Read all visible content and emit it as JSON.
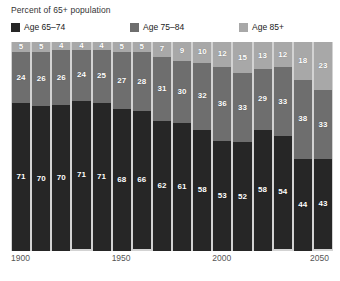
{
  "chart": {
    "title": "Percent of 65+ population",
    "legend": [
      {
        "label": "Age 65–74",
        "color": "#262626"
      },
      {
        "label": "Age 75–84",
        "color": "#6e6e6e"
      },
      {
        "label": "Age 85+",
        "color": "#a8a8a8"
      }
    ],
    "axis_ticks": [
      {
        "label": "1900",
        "pos": 0
      },
      {
        "label": "1950",
        "pos": 5
      },
      {
        "label": "2000",
        "pos": 10
      },
      {
        "label": "2050",
        "pos": 15
      }
    ],
    "plot_bg": "#d3d3d3"
  },
  "chart_data": {
    "type": "bar",
    "title": "Percent of 65+ population",
    "xlabel": "",
    "ylabel": "Percent of 65+ population",
    "ylim": [
      0,
      100
    ],
    "grid": false,
    "legend_position": "top",
    "stacked": true,
    "categories": [
      "1900",
      "1910",
      "1920",
      "1930",
      "1940",
      "1950",
      "1960",
      "1970",
      "1980",
      "1990",
      "2000",
      "2010",
      "2020",
      "2030",
      "2040",
      "2050"
    ],
    "tick_labels": [
      "1900",
      "1950",
      "2000",
      "2050"
    ],
    "series": [
      {
        "name": "Age 65–74",
        "color": "#262626",
        "values": [
          71,
          70,
          70,
          71,
          71,
          68,
          66,
          62,
          61,
          58,
          53,
          52,
          58,
          54,
          44,
          43
        ]
      },
      {
        "name": "Age 75–84",
        "color": "#6e6e6e",
        "values": [
          24,
          26,
          26,
          24,
          25,
          27,
          28,
          31,
          30,
          32,
          36,
          33,
          29,
          33,
          38,
          33
        ]
      },
      {
        "name": "Age 85+",
        "color": "#a8a8a8",
        "values": [
          5,
          5,
          4,
          4,
          4,
          5,
          5,
          7,
          9,
          10,
          12,
          15,
          13,
          12,
          18,
          23
        ]
      }
    ]
  }
}
